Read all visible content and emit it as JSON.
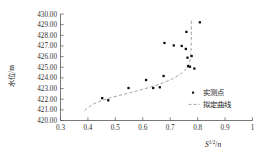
{
  "chart_data": {
    "type": "scatter",
    "title": "",
    "xlabel": "S^(1/2)/n",
    "ylabel": "水位/m",
    "xlim": [
      0.3,
      1.0
    ],
    "ylim": [
      420.0,
      430.0
    ],
    "xticks": [
      "0.3",
      "0.4",
      "0.5",
      "0.6",
      "0.7",
      "0.8",
      "0.9",
      "1"
    ],
    "yticks": [
      "430.00",
      "429.00",
      "428.00",
      "427.00",
      "426.00",
      "425.00",
      "424.00",
      "423.00",
      "422.00",
      "421.00",
      "420.00"
    ],
    "grid": false,
    "legend_position": "center-right",
    "series": [
      {
        "name": "实测点",
        "type": "scatter",
        "marker": "square",
        "color": "#111111",
        "points": [
          [
            0.452,
            422.1
          ],
          [
            0.474,
            421.9
          ],
          [
            0.548,
            423.05
          ],
          [
            0.612,
            423.8
          ],
          [
            0.638,
            423.05
          ],
          [
            0.662,
            423.12
          ],
          [
            0.676,
            424.18
          ],
          [
            0.679,
            427.28
          ],
          [
            0.713,
            427.05
          ],
          [
            0.742,
            427.0
          ],
          [
            0.757,
            426.72
          ],
          [
            0.759,
            428.32
          ],
          [
            0.763,
            425.9
          ],
          [
            0.765,
            425.1
          ],
          [
            0.772,
            425.05
          ],
          [
            0.778,
            426.05
          ],
          [
            0.788,
            424.88
          ],
          [
            0.808,
            429.22
          ]
        ]
      },
      {
        "name": "拟定曲线",
        "type": "line",
        "style": "dashed",
        "color": "#999999",
        "points": [
          [
            0.388,
            420.95
          ],
          [
            0.412,
            421.42
          ],
          [
            0.44,
            421.78
          ],
          [
            0.472,
            422.05
          ],
          [
            0.51,
            422.32
          ],
          [
            0.552,
            422.6
          ],
          [
            0.598,
            422.92
          ],
          [
            0.642,
            423.25
          ],
          [
            0.682,
            423.62
          ],
          [
            0.714,
            424.0
          ],
          [
            0.74,
            424.42
          ],
          [
            0.757,
            424.85
          ],
          [
            0.768,
            425.3
          ],
          [
            0.774,
            425.9
          ],
          [
            0.776,
            426.7
          ],
          [
            0.777,
            427.6
          ],
          [
            0.777,
            428.5
          ],
          [
            0.777,
            429.45
          ]
        ]
      }
    ]
  },
  "axes": {
    "y_title": "水位/m",
    "x_title_base": "S",
    "x_title_sup": "1/2",
    "x_title_den": "n",
    "x_title_slash": "/"
  },
  "legend": {
    "items": [
      {
        "label": "实测点",
        "marker": "square-dot"
      },
      {
        "label": "拟定曲线",
        "marker": "dashed-line"
      }
    ]
  }
}
